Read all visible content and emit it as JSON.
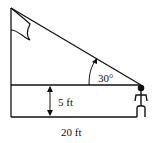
{
  "diagram": {
    "labels": {
      "angle": "30°",
      "height": "5 ft",
      "distance": "20 ft"
    },
    "colors": {
      "stroke": "#111111",
      "background": "#ffffff"
    },
    "elements": [
      "flagpole",
      "flag",
      "line-of-sight",
      "eye-level-line",
      "ground-line",
      "height-arrow",
      "angle-arc",
      "person"
    ]
  }
}
